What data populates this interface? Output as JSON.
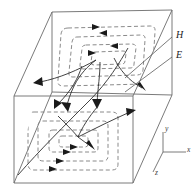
{
  "figure": {
    "background_color": "#ffffff",
    "box_edge_color": "#6b6b6b",
    "h_field_color": "#8a8a8a",
    "e_field_color": "#2e2e2e",
    "arrow_color": "#1a1a1a"
  },
  "labels": {
    "h_field": "H",
    "e_field": "E"
  },
  "axes": {
    "x": "x",
    "y": "y",
    "z": "z"
  },
  "legend": {
    "h_meaning": "magnetic-field-loops-dashed",
    "e_meaning": "electric-field-lines-solid"
  },
  "icons": {
    "arrow": "arrow-head-icon",
    "axis_triad": "axis-triad-icon"
  }
}
